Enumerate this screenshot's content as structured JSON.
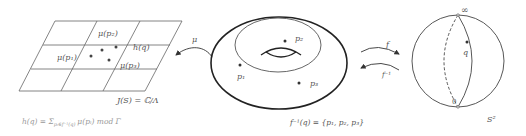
{
  "jacobian": {
    "labels": {
      "mu_p1": "μ(p₁)",
      "mu_p2": "μ(p₂)",
      "mu_p3": "μ(p₃)",
      "h_q": "h(q)",
      "caption": "J(S) = ℂ/Λ"
    },
    "formula": "h(q) = Σ",
    "formula_sub": "pᵢ∈f⁻¹(q)",
    "formula_tail": "μ(pᵢ) mod Γ"
  },
  "arrows": {
    "mu": "μ",
    "f": "f",
    "f_inv": "f⁻¹"
  },
  "torus": {
    "p1": "p₁",
    "p2": "p₂",
    "p3": "p₃",
    "caption": "f⁻¹(q) = {p₁, p₂, p₃}"
  },
  "sphere": {
    "infinity": "∞",
    "zero": "0",
    "q": "q",
    "caption": "S²"
  },
  "colors": {
    "line": "#666666",
    "dark": "#222222",
    "light_text": "#999999"
  }
}
